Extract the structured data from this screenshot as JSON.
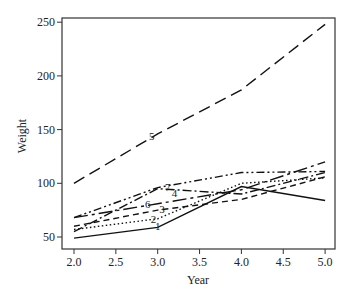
{
  "chart_data": {
    "type": "line",
    "title": "",
    "xlabel": "Year",
    "ylabel": "Weight",
    "x": [
      2.0,
      3.0,
      4.0,
      5.0
    ],
    "xlim": [
      1.85,
      5.1
    ],
    "ylim": [
      39,
      257
    ],
    "xticks": [
      "2.0",
      "2.5",
      "3.0",
      "3.5",
      "4.0",
      "4.5",
      "5.0"
    ],
    "yticks": [
      "50",
      "100",
      "150",
      "200",
      "250"
    ],
    "grid": false,
    "legend": "inline numeric labels on lines",
    "series": [
      {
        "name": "1",
        "values": [
          49,
          59,
          97,
          84
        ],
        "dash": "",
        "label_at": [
          3.0,
          60
        ]
      },
      {
        "name": "2",
        "values": [
          57,
          67,
          100,
          105
        ],
        "dash": "1.5,2.5",
        "label_at": [
          2.95,
          67
        ]
      },
      {
        "name": "3",
        "values": [
          60,
          75,
          85,
          106
        ],
        "dash": "6,4",
        "label_at": [
          3.05,
          76
        ]
      },
      {
        "name": "4",
        "values": [
          55,
          95,
          90,
          110
        ],
        "dash": "9,3,2,3",
        "label_at": [
          3.2,
          91
        ]
      },
      {
        "name": "5",
        "values": [
          100,
          146,
          187,
          248
        ],
        "dash": "12,6",
        "label_at": [
          2.93,
          144
        ]
      },
      {
        "name": "6",
        "values": [
          68,
          81,
          94,
          120
        ],
        "dash": "14,4,3,4",
        "label_at": [
          2.88,
          81
        ]
      },
      {
        "name": "7",
        "values": [
          68,
          96,
          110,
          111
        ],
        "dash": "8,3,2,3,2,3",
        "label_at": [
          3.12,
          97
        ]
      }
    ]
  }
}
